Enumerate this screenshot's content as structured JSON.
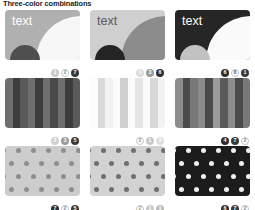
{
  "header": {
    "title": "Three-color combinations"
  },
  "palette": {
    "white": "#ffffff",
    "near_white": "#f4f4f4",
    "light_gray": "#d5d5d5",
    "mid_light_gray": "#bdbdbd",
    "mid_gray": "#9a9a9a",
    "dark_gray": "#656565",
    "darker_gray": "#4a4a4a",
    "near_black": "#2b2b2b",
    "black": "#1a1a1a"
  },
  "cards": [
    {
      "id": "text-card-1",
      "type": "text-swatch",
      "label": "text",
      "bg": "#b0b0b0",
      "label_color": "#ffffff",
      "quarter_color": "#f7f7f7",
      "circle_color": "#4f4f4f",
      "badges": [
        {
          "number": "1",
          "bg": "#c9c9c9",
          "fg": "#ffffff"
        },
        {
          "number": "2",
          "bg": "#ffffff",
          "fg": "#8d8d8d"
        },
        {
          "number": "7",
          "bg": "#3a3a3a",
          "fg": "#ffffff"
        }
      ]
    },
    {
      "id": "text-card-2",
      "type": "text-swatch",
      "label": "text",
      "bg": "#cfcfcf",
      "label_color": "#5a5a5a",
      "quarter_color": "#8c8c8c",
      "circle_color": "#242424",
      "badges": [
        {
          "number": "1",
          "bg": "#dcdcdc",
          "fg": "#ffffff"
        },
        {
          "number": "3",
          "bg": "#9a9a9a",
          "fg": "#ffffff"
        },
        {
          "number": "6",
          "bg": "#2e2e2e",
          "fg": "#ffffff"
        }
      ]
    },
    {
      "id": "text-card-3",
      "type": "text-swatch",
      "label": "text",
      "bg": "#262626",
      "label_color": "#ffffff",
      "quarter_color": "#fafafa",
      "circle_color": "#c2c2c2",
      "badges": [
        {
          "number": "6",
          "bg": "#2e2e2e",
          "fg": "#ffffff"
        },
        {
          "number": "8",
          "bg": "#ffffff",
          "fg": "#6e6e6e"
        },
        {
          "number": "1",
          "bg": "#3a3a3a",
          "fg": "#ffffff"
        }
      ]
    },
    {
      "id": "stripe-card-1",
      "type": "stripes",
      "stripe_colors": [
        "#6e6e6e",
        "#3d3d3d",
        "#5a5a5a",
        "#6e6e6e",
        "#3d3d3d",
        "#6e6e6e",
        "#4a4a4a",
        "#6e6e6e",
        "#3d3d3d",
        "#5a5a5a"
      ],
      "badges": [
        {
          "number": "2",
          "bg": "#cfcfcf",
          "fg": "#ffffff"
        },
        {
          "number": "3",
          "bg": "#9a9a9a",
          "fg": "#ffffff"
        },
        {
          "number": "5",
          "bg": "#3a3a3a",
          "fg": "#ffffff"
        }
      ]
    },
    {
      "id": "stripe-card-2",
      "type": "stripes",
      "stripe_colors": [
        "#fbfbfb",
        "#d9d9d9",
        "#f2f2f2",
        "#fbfbfb",
        "#cfcfcf",
        "#fbfbfb",
        "#e4e4e4",
        "#fbfbfb",
        "#d9d9d9",
        "#f2f2f2"
      ],
      "badges": [
        {
          "number": "2",
          "bg": "#ffffff",
          "fg": "#9a9a9a"
        },
        {
          "number": "1",
          "bg": "#c9c9c9",
          "fg": "#ffffff"
        },
        {
          "number": "3",
          "bg": "#dedede",
          "fg": "#ffffff"
        }
      ]
    },
    {
      "id": "stripe-card-3",
      "type": "stripes",
      "stripe_colors": [
        "#8c8c8c",
        "#4a4a4a",
        "#787878",
        "#8c8c8c",
        "#4a4a4a",
        "#9a9a9a",
        "#5a5a5a",
        "#8c8c8c",
        "#4a4a4a",
        "#787878"
      ],
      "badges": [
        {
          "number": "4",
          "bg": "#2e2e2e",
          "fg": "#ffffff"
        },
        {
          "number": "7",
          "bg": "#3a3a3a",
          "fg": "#ffffff"
        },
        {
          "number": "2",
          "bg": "#ffffff",
          "fg": "#8d8d8d"
        }
      ]
    },
    {
      "id": "dot-card-1",
      "type": "dots",
      "bg": "#cdcdcd",
      "dot_color": "#8f8f8f",
      "badges": [
        {
          "number": "7",
          "bg": "#2e2e2e",
          "fg": "#ffffff"
        },
        {
          "number": "2",
          "bg": "#ffffff",
          "fg": "#8d8d8d"
        },
        {
          "number": "5",
          "bg": "#3a3a3a",
          "fg": "#ffffff"
        }
      ]
    },
    {
      "id": "dot-card-2",
      "type": "dots",
      "bg": "#d2d2d2",
      "dot_color": "#707070",
      "badges": [
        {
          "number": "2",
          "bg": "#ffffff",
          "fg": "#9a9a9a"
        },
        {
          "number": "1",
          "bg": "#c9c9c9",
          "fg": "#ffffff"
        },
        {
          "number": "1",
          "bg": "#bdbdbd",
          "fg": "#ffffff"
        }
      ]
    },
    {
      "id": "dot-card-3",
      "type": "dots",
      "bg": "#1c1c1c",
      "dot_color": "#efefef",
      "badges": [
        {
          "number": "6",
          "bg": "#2e2e2e",
          "fg": "#ffffff"
        },
        {
          "number": "7",
          "bg": "#3a3a3a",
          "fg": "#ffffff"
        },
        {
          "number": "2",
          "bg": "#ffffff",
          "fg": "#8d8d8d"
        }
      ]
    }
  ]
}
